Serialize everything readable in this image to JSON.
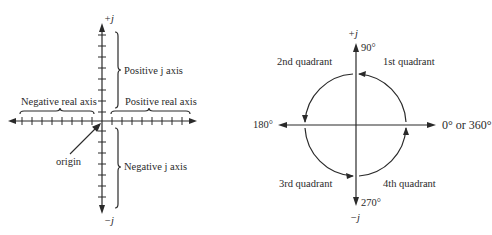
{
  "colors": {
    "ink": "#2a2a2a",
    "background": "#ffffff"
  },
  "left_diagram": {
    "title": "Complex plane axes",
    "top_label": "+j",
    "bottom_label": "−j",
    "positive_j_axis": "Positive j axis",
    "negative_j_axis": "Negative j axis",
    "negative_real_axis": "Negative real axis",
    "positive_real_axis": "Positive real axis",
    "origin": "origin",
    "tick_count_per_half_axis": 8
  },
  "right_diagram": {
    "title": "Quadrants and angles",
    "top_label": "+j",
    "bottom_label": "−j",
    "angle_90": "90°",
    "angle_180": "180°",
    "angle_270": "270°",
    "angle_0": "0° or 360°",
    "quadrants": [
      {
        "name": "1st quadrant"
      },
      {
        "name": "2nd quadrant"
      },
      {
        "name": "3rd quadrant"
      },
      {
        "name": "4th quadrant"
      }
    ]
  }
}
